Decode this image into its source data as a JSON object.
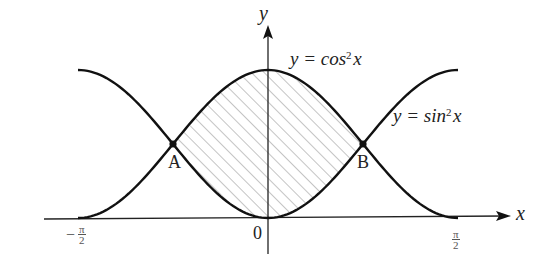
{
  "diagram": {
    "axes": {
      "x_label": "x",
      "y_label": "y",
      "origin_label": "0",
      "x_ticks": [
        {
          "sign": "−",
          "numerator": "π",
          "denominator": "2",
          "value": "-π/2"
        },
        {
          "sign": "",
          "numerator": "π",
          "denominator": "2",
          "value": "π/2"
        }
      ]
    },
    "curves": [
      {
        "name": "cos-squared",
        "label_prefix": "y = cos",
        "label_exp": "2",
        "label_suffix": "x"
      },
      {
        "name": "sin-squared",
        "label_prefix": "y = sin",
        "label_exp": "2",
        "label_suffix": "x"
      }
    ],
    "points": [
      {
        "name": "A",
        "label": "A"
      },
      {
        "name": "B",
        "label": "B"
      }
    ],
    "shaded_region": "between curves from A to B (hatched)",
    "colors": {
      "stroke": "#111111",
      "hatch": "#888888",
      "background": "#ffffff"
    }
  }
}
